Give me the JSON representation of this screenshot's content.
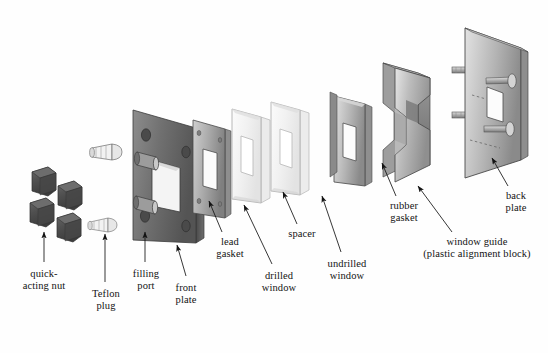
{
  "figure": {
    "type": "exploded-assembly-diagram",
    "background_color": "#fefefe",
    "ink_color": "#131313",
    "style": "grayscale halftone technical illustration"
  },
  "labels": [
    {
      "id": "quick-acting-nut",
      "lines": [
        "quick-",
        "acting nut"
      ],
      "x": 12,
      "y": 268,
      "leader": {
        "from": [
          44,
          262
        ],
        "to": [
          44,
          232
        ],
        "arrow": "up"
      }
    },
    {
      "id": "teflon-plug",
      "lines": [
        "Teflon",
        "plug"
      ],
      "x": 86,
      "y": 288,
      "leader": {
        "from": [
          105,
          282
        ],
        "to": [
          105,
          234
        ],
        "arrow": "up"
      }
    },
    {
      "id": "filling-port",
      "lines": [
        "filling",
        "port"
      ],
      "x": 128,
      "y": 268,
      "leader": {
        "from": [
          145,
          262
        ],
        "to": [
          145,
          232
        ],
        "arrow": "up"
      }
    },
    {
      "id": "front-plate",
      "lines": [
        "front",
        "plate"
      ],
      "x": 168,
      "y": 282,
      "leader": {
        "from": [
          186,
          276
        ],
        "to": [
          177,
          245
        ],
        "arrow": "up-left"
      }
    },
    {
      "id": "lead-gasket",
      "lines": [
        "lead",
        "gasket"
      ],
      "x": 214,
      "y": 236,
      "leader": {
        "from": [
          222,
          232
        ],
        "to": [
          209,
          201
        ],
        "arrow": "up-left"
      }
    },
    {
      "id": "drilled-window",
      "lines": [
        "drilled",
        "window"
      ],
      "x": 260,
      "y": 270,
      "leader": {
        "from": [
          272,
          264
        ],
        "to": [
          244,
          205
        ],
        "arrow": "up-left"
      }
    },
    {
      "id": "spacer",
      "lines": [
        "spacer"
      ],
      "x": 288,
      "y": 228,
      "leader": {
        "from": [
          297,
          224
        ],
        "to": [
          283,
          192
        ],
        "arrow": "up-left"
      }
    },
    {
      "id": "undrilled-window",
      "lines": [
        "undrilled",
        "window"
      ],
      "x": 327,
      "y": 258,
      "leader": {
        "from": [
          341,
          252
        ],
        "to": [
          322,
          196
        ],
        "arrow": "up-left"
      }
    },
    {
      "id": "rubber-gasket",
      "lines": [
        "rubber",
        "gasket"
      ],
      "x": 387,
      "y": 200,
      "leader": {
        "from": [
          396,
          196
        ],
        "to": [
          382,
          163
        ],
        "arrow": "up-left"
      }
    },
    {
      "id": "window-guide",
      "lines": [
        "window guide",
        "(plastic alignment block)"
      ],
      "x": 414,
      "y": 236,
      "leader": {
        "from": [
          452,
          232
        ],
        "to": [
          418,
          186
        ],
        "arrow": "up-left"
      }
    },
    {
      "id": "back-plate",
      "lines": [
        "back",
        "plate"
      ],
      "x": 503,
      "y": 190,
      "leader": {
        "from": [
          508,
          186
        ],
        "to": [
          492,
          158
        ],
        "arrow": "up-left"
      }
    }
  ],
  "parts": [
    {
      "id": "quick-acting-nut",
      "name": "quick-acting nut",
      "count": 4,
      "tone": "dark",
      "shape": "knurled cylinder"
    },
    {
      "id": "teflon-plug",
      "name": "Teflon plug",
      "count": 2,
      "tone": "light",
      "shape": "bullet-nose plug"
    },
    {
      "id": "front-plate",
      "name": "front plate",
      "count": 1,
      "tone": "dark",
      "shape": "plate with window, 4 corner holes, 2 filling ports"
    },
    {
      "id": "lead-gasket",
      "name": "lead gasket",
      "count": 1,
      "tone": "medium",
      "shape": "thin framed plate"
    },
    {
      "id": "drilled-window",
      "name": "drilled window",
      "count": 1,
      "tone": "translucent",
      "shape": "clear framed pane"
    },
    {
      "id": "spacer",
      "name": "spacer",
      "count": 1,
      "tone": "translucent",
      "shape": "clear framed pane"
    },
    {
      "id": "undrilled-window",
      "name": "undrilled window",
      "count": 1,
      "tone": "medium",
      "shape": "framed pane"
    },
    {
      "id": "rubber-gasket",
      "name": "rubber gasket",
      "count": 1,
      "tone": "medium",
      "shape": "thin framed plate"
    },
    {
      "id": "window-guide",
      "name": "window guide (plastic alignment block)",
      "count": 1,
      "tone": "medium",
      "shape": "thick notched frame block"
    },
    {
      "id": "back-plate",
      "name": "back plate",
      "count": 1,
      "tone": "medium",
      "shape": "plate with 4 threaded studs"
    }
  ]
}
